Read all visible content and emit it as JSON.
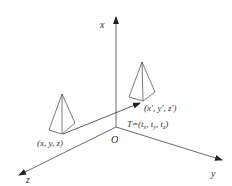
{
  "diagram": {
    "type": "3d-coordinate-translation",
    "axes": {
      "x_label": "x",
      "y_label": "y",
      "z_label": "z",
      "origin_label": "O"
    },
    "objects": [
      {
        "name": "original-pyramid",
        "label": "(x, y, z)"
      },
      {
        "name": "translated-pyramid",
        "label": "(x′, y′, z′)"
      }
    ],
    "translation_label": "T=(tx, ty, tz)",
    "translation": {
      "prefix": "T=(",
      "tx": "t",
      "tx_sub": "x",
      "ty": "t",
      "ty_sub": "y",
      "tz": "t",
      "tz_sub": "z"
    },
    "colors": {
      "line": "#333333",
      "background": "#ffffff"
    }
  }
}
